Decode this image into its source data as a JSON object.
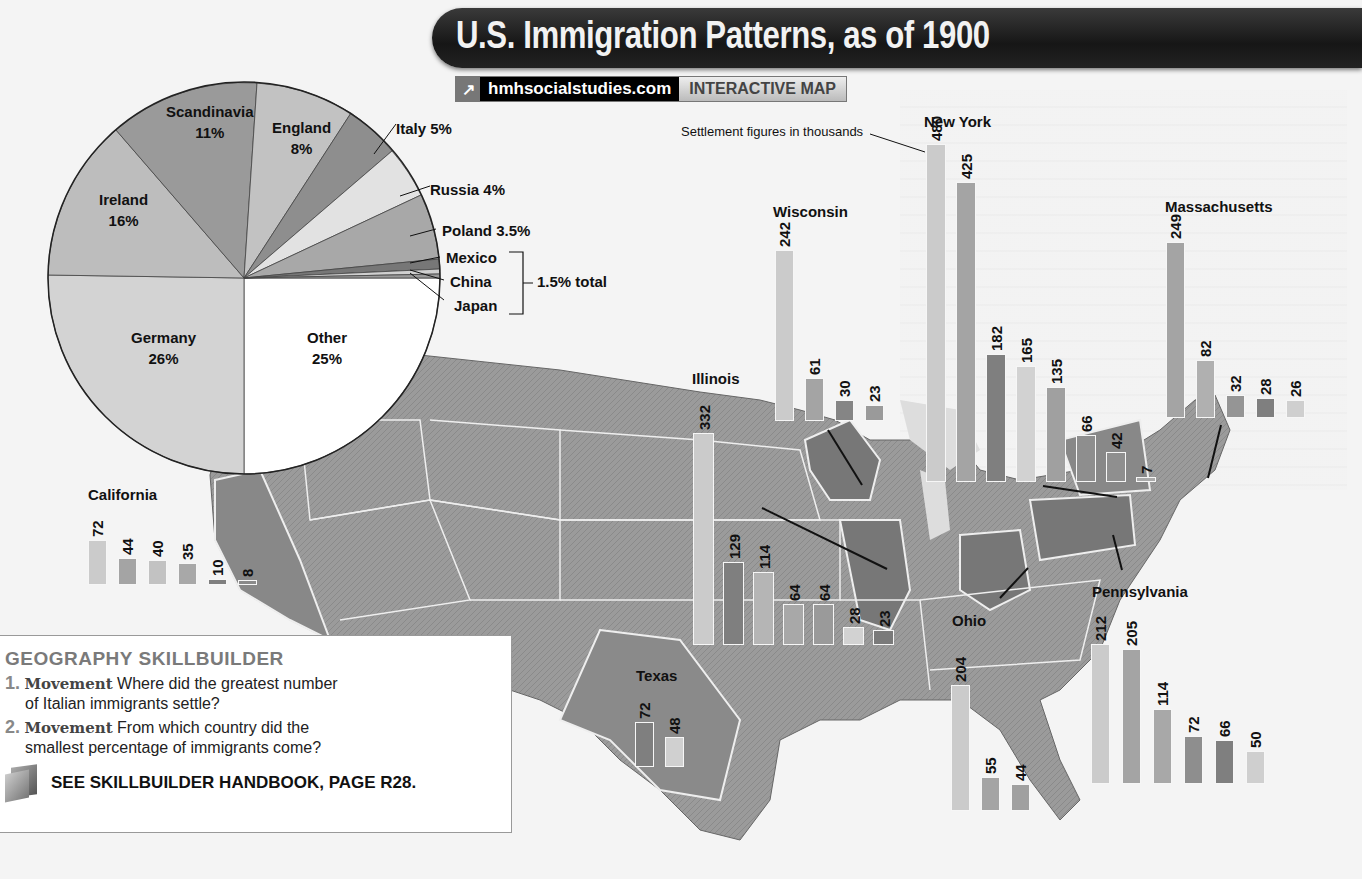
{
  "title": "U.S. Immigration Patterns, as of 1900",
  "link": {
    "icon": "external-link-arrow-icon",
    "site": "hmhsocialstudies.com",
    "tag": "INTERACTIVE MAP"
  },
  "note": "Settlement figures in thousands",
  "colors": {
    "banner": "#1c1c1c",
    "bar_light": "#c8c8c8",
    "bar_mid": "#a3a3a3",
    "bar_dark": "#7f7f7f",
    "map": "#9a9a9a"
  },
  "chart_data": [
    {
      "type": "pie",
      "title": "Immigrant origins, as of 1900",
      "categories": [
        "Germany",
        "Ireland",
        "Scandinavia",
        "England",
        "Italy",
        "Russia",
        "Poland",
        "Mexico",
        "China",
        "Japan",
        "Other"
      ],
      "values": [
        26,
        16,
        11,
        8,
        5,
        4,
        3.5,
        0.5,
        0.5,
        0.5,
        25
      ],
      "labels": {
        "Germany": "Germany 26%",
        "Ireland": "Ireland 16%",
        "Scandinavia": "Scandinavia 11%",
        "England": "England 8%",
        "Italy": "Italy 5%",
        "Russia": "Russia 4%",
        "Poland": "Poland 3.5%",
        "Mexico": "Mexico",
        "China": "China",
        "Japan": "Japan",
        "Other": "Other 25%"
      },
      "annotation": "Mexico, China, Japan: 1.5% total"
    },
    {
      "type": "bar",
      "title": "Settlement figures in thousands (by state)",
      "series": [
        {
          "name": "New York",
          "values": [
            480,
            425,
            182,
            165,
            135,
            66,
            42,
            7
          ]
        },
        {
          "name": "Illinois",
          "values": [
            332,
            129,
            114,
            64,
            64,
            28,
            23
          ]
        },
        {
          "name": "Wisconsin",
          "values": [
            242,
            61,
            30,
            23
          ]
        },
        {
          "name": "Massachusetts",
          "values": [
            249,
            82,
            32,
            28,
            26
          ]
        },
        {
          "name": "Pennsylvania",
          "values": [
            212,
            205,
            114,
            72,
            66,
            50
          ]
        },
        {
          "name": "Ohio",
          "values": [
            204,
            55,
            44
          ]
        },
        {
          "name": "California",
          "values": [
            72,
            44,
            40,
            35,
            10,
            8
          ]
        },
        {
          "name": "Texas",
          "values": [
            72,
            48
          ]
        }
      ],
      "ylabel": "Thousands of immigrants"
    }
  ],
  "pie_labels": {
    "scandinavia": [
      "Scandinavia",
      "11%"
    ],
    "england": [
      "England",
      "8%"
    ],
    "ireland": [
      "Ireland",
      "16%"
    ],
    "germany": [
      "Germany",
      "26%"
    ],
    "other": [
      "Other",
      "25%"
    ],
    "italy": "Italy 5%",
    "russia": "Russia 4%",
    "poland": "Poland 3.5%",
    "mexico": "Mexico",
    "china": "China",
    "japan": "Japan",
    "total": "1.5% total"
  },
  "states": {
    "california": {
      "name": "California",
      "values": [
        "72",
        "44",
        "40",
        "35",
        "10",
        "8"
      ]
    },
    "texas": {
      "name": "Texas",
      "values": [
        "72",
        "48"
      ]
    },
    "illinois": {
      "name": "Illinois",
      "values": [
        "332",
        "129",
        "114",
        "64",
        "64",
        "28",
        "23"
      ]
    },
    "wisconsin": {
      "name": "Wisconsin",
      "values": [
        "242",
        "61",
        "30",
        "23"
      ]
    },
    "newyork": {
      "name": "New York",
      "values": [
        "480",
        "425",
        "182",
        "165",
        "135",
        "66",
        "42",
        "7"
      ]
    },
    "massachusetts": {
      "name": "Massachusetts",
      "values": [
        "249",
        "82",
        "32",
        "28",
        "26"
      ]
    },
    "ohio": {
      "name": "Ohio",
      "values": [
        "204",
        "55",
        "44"
      ]
    },
    "pennsylvania": {
      "name": "Pennsylvania",
      "values": [
        "212",
        "205",
        "114",
        "72",
        "66",
        "50"
      ]
    }
  },
  "skillbuilder": {
    "heading": "GEOGRAPHY SKILLBUILDER",
    "questions": [
      {
        "num": "1.",
        "keyword": "Movement",
        "line1": " Where did the greatest number",
        "line2": "of Italian immigrants settle?"
      },
      {
        "num": "2.",
        "keyword": "Movement",
        "line1": " From which country did the",
        "line2": "smallest percentage of immigrants come?"
      }
    ],
    "see": "SEE SKILLBUILDER HANDBOOK, PAGE R28."
  }
}
